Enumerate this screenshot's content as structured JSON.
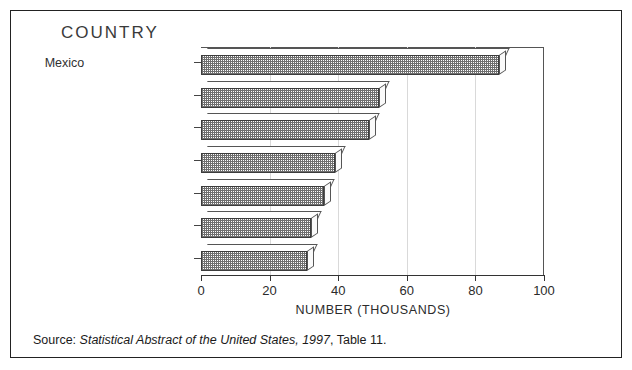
{
  "figure": {
    "chart_title": "COUNTRY",
    "source_prefix": "Source:",
    "source_italic": "Statistical Abstract of the United States, 1997",
    "source_suffix": ", Table 11."
  },
  "chart_data": {
    "type": "bar",
    "orientation": "horizontal",
    "title": "COUNTRY",
    "xlabel": "NUMBER (THOUSANDS)",
    "ylabel": "COUNTRY",
    "xlim": [
      0,
      100
    ],
    "xticks": [
      0,
      20,
      40,
      60,
      80,
      100
    ],
    "xticklabels": [
      "0",
      "20",
      "40",
      "60",
      "80",
      "100"
    ],
    "grid": true,
    "legend": null,
    "categories": [
      "Mexico",
      "Soviet Un.(FMR)",
      "Philippines",
      "Vietnam",
      "Dominican Rep.",
      "China",
      "India"
    ],
    "values": [
      89,
      54,
      51,
      41,
      38,
      34,
      33
    ],
    "units": "thousands",
    "annotation": "Source: Statistical Abstract of the United States, 1997, Table 11."
  }
}
